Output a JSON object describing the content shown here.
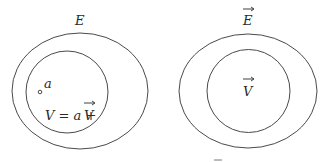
{
  "left_diagram": {
    "outer_label": "E",
    "point_label": "a",
    "inner_label_lhs": "V = a + ",
    "inner_label_vec": "V"
  },
  "right_diagram": {
    "outer_label": "E",
    "inner_label": "V"
  },
  "colors": {
    "stroke": "#4a4a4a",
    "text": "#2a2a2a",
    "background": "#ffffff"
  }
}
